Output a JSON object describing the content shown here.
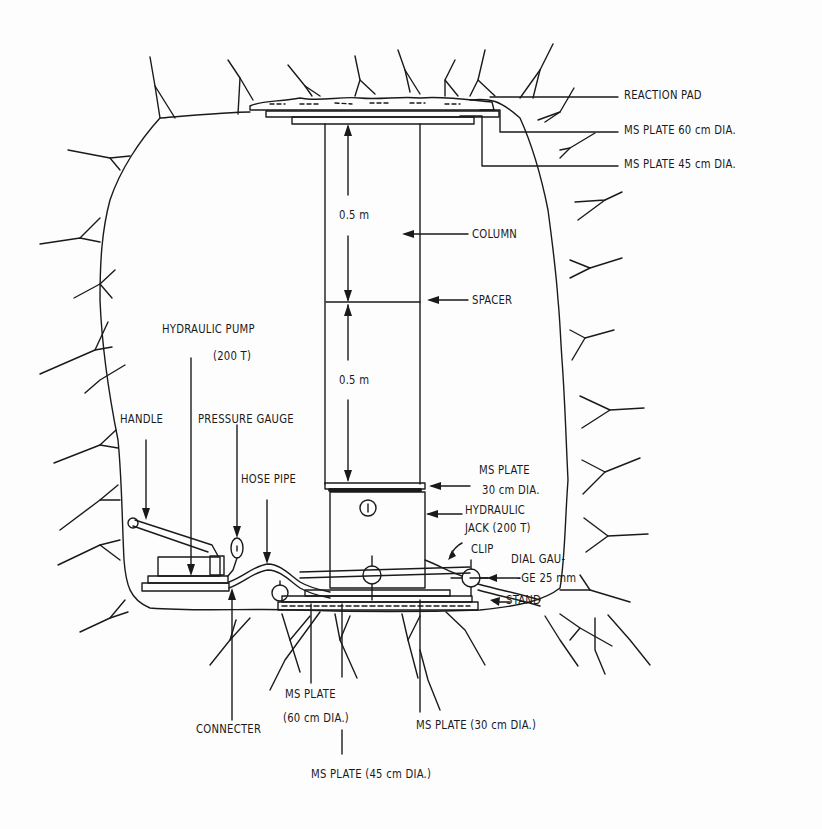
{
  "figure": {
    "colors": {
      "ink": "#1a1a1a",
      "background": "#fdfdfd"
    }
  },
  "labels": {
    "reaction_pad": "REACTION PAD",
    "ms_plate_top_60": "MS PLATE 60 cm DIA.",
    "ms_plate_top_45": "MS PLATE 45 cm DIA.",
    "column": "COLUMN",
    "spacer": "SPACER",
    "dim_upper": "0.5 m",
    "dim_lower": "0.5 m",
    "hydraulic_pump_line1": "HYDRAULIC PUMP",
    "hydraulic_pump_line2": "(200 T)",
    "handle": "HANDLE",
    "pressure_gauge": "PRESSURE GAUGE",
    "hose_pipe": "HOSE PIPE",
    "ms_plate_30_line1": "MS PLATE",
    "ms_plate_30_line2": "30 cm DIA.",
    "hydraulic_jack_line1": "HYDRAULIC",
    "hydraulic_jack_line2": "JACK (200 T)",
    "clip": "CLIP",
    "dial_gauge_line1": "DIAL GAU-",
    "dial_gauge_line2": "-GE 25 mm",
    "stand": "STAND",
    "connecter": "CONNECTER",
    "ms_plate_bottom_60_line1": "MS PLATE",
    "ms_plate_bottom_60_line2": "(60 cm DIA.)",
    "ms_plate_bottom_30": "MS PLATE (30 cm DIA.)",
    "ms_plate_bottom_45": "MS PLATE (45 cm DIA.)",
    "gauge_mark": "1"
  }
}
